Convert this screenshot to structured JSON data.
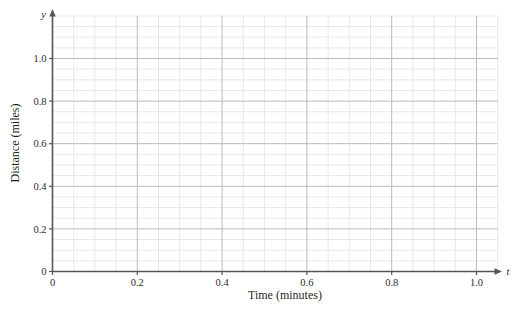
{
  "chart_data": {
    "type": "line",
    "title": "",
    "subtitle": "",
    "xlabel": "Time (minutes)",
    "ylabel": "Distance (miles)",
    "x_axis_variable": "t",
    "y_axis_variable": "y",
    "xlim": [
      0,
      1.05
    ],
    "ylim": [
      0,
      1.2
    ],
    "x_ticks": [
      0,
      0.2,
      0.4,
      0.6,
      0.8,
      1.0
    ],
    "x_tick_labels": [
      "0",
      "0.2",
      "0.4",
      "0.6",
      "0.8",
      "1.0"
    ],
    "y_ticks": [
      0,
      0.2,
      0.4,
      0.6,
      0.8,
      1.0
    ],
    "y_tick_labels": [
      "0",
      "0.2",
      "0.4",
      "0.6",
      "0.8",
      "1.0"
    ],
    "x_minor_step": 0.05,
    "y_minor_step": 0.05,
    "grid": true,
    "grid_minor": true,
    "legend": null,
    "legend_position": "none",
    "series": [],
    "annotations": [],
    "colors": {
      "background": "#ffffff",
      "axis": "#555555",
      "grid_major": "#bbbbbb",
      "grid_minor": "#e2e2e2",
      "text": "#2b2b2b"
    }
  },
  "labels": {
    "x_title": "Time (minutes)",
    "y_title": "Distance (miles)",
    "x_var": "t",
    "y_var": "y"
  }
}
